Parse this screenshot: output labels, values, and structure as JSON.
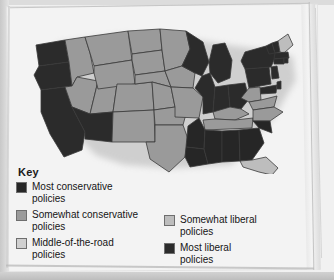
{
  "page": {
    "background_color": "#f3f3f3",
    "border_color": "#c8c8c8"
  },
  "legend": {
    "title": "Key",
    "left_column": [
      {
        "swatch_color": "#262626",
        "label_line1": "Most conservative",
        "label_line2": "policies",
        "icon": "color-swatch"
      },
      {
        "swatch_color": "#9a9a9a",
        "label_line1": "Somewhat conservative",
        "label_line2": "policies",
        "icon": "color-swatch"
      },
      {
        "swatch_color": "#d0d0d0",
        "label_line1": "Middle-of-the-road",
        "label_line2": "policies",
        "icon": "color-swatch"
      }
    ],
    "right_column": [
      {
        "swatch_color": "#bdbdbd",
        "label_line1": "Somewhat liberal",
        "label_line2": "policies",
        "icon": "color-swatch"
      },
      {
        "swatch_color": "#2b2b2b",
        "label_line1": "Most liberal",
        "label_line2": "policies",
        "icon": "color-swatch"
      }
    ]
  },
  "map": {
    "name": "united-states-choropleth",
    "outline_color": "#3a3a3a",
    "colors": {
      "most_conservative": "#262626",
      "somewhat_conservative": "#9a9a9a",
      "middle_of_the_road": "#d0d0d0",
      "somewhat_liberal": "#bdbdbd",
      "most_liberal": "#2b2b2b",
      "water": "#f3f3f3"
    },
    "states": [
      {
        "code": "WA",
        "category": "most_liberal"
      },
      {
        "code": "OR",
        "category": "most_liberal"
      },
      {
        "code": "CA",
        "category": "most_liberal"
      },
      {
        "code": "AZ",
        "category": "most_liberal"
      },
      {
        "code": "ID",
        "category": "somewhat_conservative"
      },
      {
        "code": "NV",
        "category": "somewhat_conservative"
      },
      {
        "code": "UT",
        "category": "somewhat_conservative"
      },
      {
        "code": "MT",
        "category": "somewhat_conservative"
      },
      {
        "code": "WY",
        "category": "somewhat_conservative"
      },
      {
        "code": "CO",
        "category": "somewhat_conservative"
      },
      {
        "code": "NM",
        "category": "somewhat_conservative"
      },
      {
        "code": "ND",
        "category": "somewhat_conservative"
      },
      {
        "code": "SD",
        "category": "somewhat_conservative"
      },
      {
        "code": "NE",
        "category": "somewhat_conservative"
      },
      {
        "code": "KS",
        "category": "somewhat_conservative"
      },
      {
        "code": "OK",
        "category": "somewhat_conservative"
      },
      {
        "code": "TX",
        "category": "somewhat_conservative"
      },
      {
        "code": "MN",
        "category": "somewhat_conservative"
      },
      {
        "code": "IA",
        "category": "somewhat_conservative"
      },
      {
        "code": "MO",
        "category": "somewhat_conservative"
      },
      {
        "code": "AR",
        "category": "most_conservative"
      },
      {
        "code": "LA",
        "category": "most_conservative"
      },
      {
        "code": "MS",
        "category": "most_conservative"
      },
      {
        "code": "AL",
        "category": "most_conservative"
      },
      {
        "code": "GA",
        "category": "most_conservative"
      },
      {
        "code": "SC",
        "category": "most_conservative"
      },
      {
        "code": "FL",
        "category": "somewhat_liberal"
      },
      {
        "code": "NC",
        "category": "somewhat_conservative"
      },
      {
        "code": "TN",
        "category": "somewhat_conservative"
      },
      {
        "code": "KY",
        "category": "somewhat_conservative"
      },
      {
        "code": "VA",
        "category": "somewhat_conservative"
      },
      {
        "code": "WV",
        "category": "somewhat_conservative"
      },
      {
        "code": "WI",
        "category": "most_liberal"
      },
      {
        "code": "MI",
        "category": "most_liberal"
      },
      {
        "code": "IL",
        "category": "most_liberal"
      },
      {
        "code": "IN",
        "category": "most_liberal"
      },
      {
        "code": "OH",
        "category": "most_liberal"
      },
      {
        "code": "PA",
        "category": "most_liberal"
      },
      {
        "code": "NY",
        "category": "most_liberal"
      },
      {
        "code": "NJ",
        "category": "most_liberal"
      },
      {
        "code": "MD",
        "category": "most_liberal"
      },
      {
        "code": "DE",
        "category": "most_liberal"
      },
      {
        "code": "CT",
        "category": "most_liberal"
      },
      {
        "code": "RI",
        "category": "most_liberal"
      },
      {
        "code": "MA",
        "category": "most_liberal"
      },
      {
        "code": "VT",
        "category": "most_liberal"
      },
      {
        "code": "NH",
        "category": "most_liberal"
      },
      {
        "code": "ME",
        "category": "somewhat_liberal"
      }
    ]
  }
}
